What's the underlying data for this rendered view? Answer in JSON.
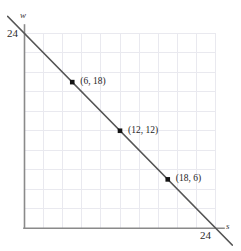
{
  "figure": {
    "width": 241,
    "height": 251,
    "background": "#ffffff"
  },
  "chart_data": {
    "type": "line",
    "title": "",
    "subtitle": "",
    "xlabel": "s",
    "ylabel": "w",
    "xlim": [
      0,
      24
    ],
    "ylim": [
      0,
      24
    ],
    "grid": true,
    "grid_step": 2.4,
    "grid_divisions": 10,
    "legend": "none",
    "line": {
      "name": "s + w = 24",
      "equation": "w = 24 - s",
      "slope": -1,
      "intercept": 24,
      "x_intercept": 24,
      "y_intercept": 24,
      "color": "#555555",
      "extends_beyond_axes": true
    },
    "series": [
      {
        "name": "s + w = 24",
        "x": [
          0,
          6,
          12,
          18,
          24
        ],
        "y": [
          24,
          18,
          12,
          6,
          0
        ]
      }
    ],
    "points": [
      {
        "x": 6,
        "y": 18,
        "label": "(6, 18)"
      },
      {
        "x": 12,
        "y": 12,
        "label": "(12, 12)"
      },
      {
        "x": 18,
        "y": 6,
        "label": "(18, 6)"
      }
    ],
    "xticks": [
      {
        "value": 24,
        "label": "24"
      }
    ],
    "yticks": [
      {
        "value": 24,
        "label": "24"
      }
    ],
    "axis_labels": {
      "x": "s",
      "y": "w"
    }
  },
  "colors": {
    "grid": "#e9e9ef",
    "axis": "#8a8a8a",
    "line": "#555555",
    "marker": "#141414",
    "text": "#222222"
  },
  "tick_labels": {
    "y_top": "24",
    "x_right": "24"
  },
  "point_labels": {
    "p1": "(6, 18)",
    "p2": "(12, 12)",
    "p3": "(18, 6)"
  },
  "axis_names": {
    "vertical": "w",
    "horizontal": "s"
  }
}
